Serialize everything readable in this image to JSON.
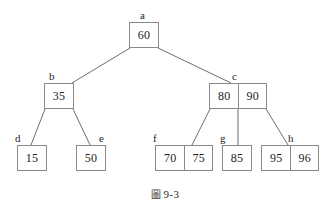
{
  "figure": {
    "caption_glyph": "圖",
    "caption_text": "9-3",
    "caption_full": "圖 9-3",
    "type": "b-tree-diagram"
  },
  "colors": {
    "background": "#ffffff",
    "box_border": "#8a8a8a",
    "edge_line": "#6e6e6e",
    "text": "#1d1d1d"
  },
  "nodes": [
    {
      "id": "a",
      "label": "a",
      "keys": [
        "60"
      ],
      "level": 0,
      "box": {
        "x": 129,
        "y": 22,
        "w": 30,
        "h": 26
      },
      "label_pos": {
        "x": 140,
        "y": 10
      }
    },
    {
      "id": "b",
      "label": "b",
      "keys": [
        "35"
      ],
      "level": 1,
      "box": {
        "x": 44,
        "y": 83,
        "w": 30,
        "h": 26
      },
      "label_pos": {
        "x": 49,
        "y": 71
      }
    },
    {
      "id": "c",
      "label": "c",
      "keys": [
        "80",
        "90"
      ],
      "level": 1,
      "box": {
        "x": 209,
        "y": 83,
        "w": 58,
        "h": 26
      },
      "label_pos": {
        "x": 232,
        "y": 71
      }
    },
    {
      "id": "d",
      "label": "d",
      "keys": [
        "15"
      ],
      "level": 2,
      "box": {
        "x": 17,
        "y": 145,
        "w": 30,
        "h": 26
      },
      "label_pos": {
        "x": 15,
        "y": 133
      }
    },
    {
      "id": "e",
      "label": "e",
      "keys": [
        "50"
      ],
      "level": 2,
      "box": {
        "x": 76,
        "y": 145,
        "w": 30,
        "h": 26
      },
      "label_pos": {
        "x": 99,
        "y": 133
      }
    },
    {
      "id": "f",
      "label": "f",
      "keys": [
        "70",
        "75"
      ],
      "level": 2,
      "box": {
        "x": 155,
        "y": 145,
        "w": 58,
        "h": 26
      },
      "label_pos": {
        "x": 153,
        "y": 133
      }
    },
    {
      "id": "g",
      "label": "g",
      "keys": [
        "85"
      ],
      "level": 2,
      "box": {
        "x": 222,
        "y": 145,
        "w": 30,
        "h": 26
      },
      "label_pos": {
        "x": 220,
        "y": 133
      }
    },
    {
      "id": "h",
      "label": "h",
      "keys": [
        "95",
        "96"
      ],
      "level": 2,
      "box": {
        "x": 261,
        "y": 145,
        "w": 58,
        "h": 26
      },
      "label_pos": {
        "x": 288,
        "y": 133
      }
    }
  ],
  "edges": [
    {
      "from": "a",
      "to": "b",
      "x1": 130,
      "y1": 48,
      "x2": 72,
      "y2": 83
    },
    {
      "from": "a",
      "to": "c",
      "x1": 158,
      "y1": 48,
      "x2": 231,
      "y2": 83
    },
    {
      "from": "b",
      "to": "d",
      "x1": 45,
      "y1": 109,
      "x2": 31,
      "y2": 145
    },
    {
      "from": "b",
      "to": "e",
      "x1": 73,
      "y1": 109,
      "x2": 90,
      "y2": 145
    },
    {
      "from": "c",
      "to": "f",
      "x1": 210,
      "y1": 109,
      "x2": 192,
      "y2": 145
    },
    {
      "from": "c",
      "to": "g",
      "x1": 238,
      "y1": 109,
      "x2": 238,
      "y2": 145
    },
    {
      "from": "c",
      "to": "h",
      "x1": 266,
      "y1": 109,
      "x2": 288,
      "y2": 145
    }
  ]
}
